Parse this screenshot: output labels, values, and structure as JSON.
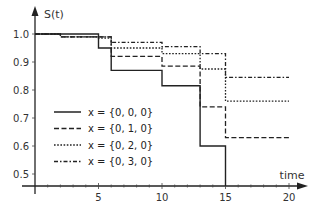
{
  "chart_data": {
    "type": "line",
    "subtype": "step",
    "title": "",
    "xlabel": "time",
    "ylabel": "S(t)",
    "xlim": [
      0,
      20
    ],
    "ylim": [
      0.45,
      1.0
    ],
    "x_ticks": [
      5,
      10,
      15,
      20
    ],
    "x_tick_labels": [
      "5",
      "10",
      "15",
      "20"
    ],
    "y_ticks": [
      0.5,
      0.6,
      0.7,
      0.8,
      0.9,
      1.0
    ],
    "y_tick_labels": [
      "0.5",
      "0.6",
      "0.7",
      "0.8",
      "0.9",
      "1.0"
    ],
    "grid": false,
    "legend_position": "lower-left inside",
    "series": [
      {
        "name": "x = {0, 0, 0}",
        "style": "solid",
        "steps": [
          [
            0,
            1.0
          ],
          [
            5,
            0.95
          ],
          [
            6,
            0.87
          ],
          [
            10,
            0.815
          ],
          [
            13,
            0.6
          ],
          [
            15,
            0.0
          ]
        ],
        "end": 15
      },
      {
        "name": "x = {0, 1, 0}",
        "style": "dashed",
        "steps": [
          [
            0,
            1.0
          ],
          [
            2,
            0.99
          ],
          [
            5,
            0.99
          ],
          [
            6,
            0.92
          ],
          [
            10,
            0.885
          ],
          [
            13,
            0.74
          ],
          [
            15,
            0.63
          ]
        ],
        "end": 20
      },
      {
        "name": "x = {0, 2, 0}",
        "style": "dotted",
        "steps": [
          [
            0,
            1.0
          ],
          [
            2,
            0.99
          ],
          [
            5,
            0.985
          ],
          [
            6,
            0.95
          ],
          [
            10,
            0.93
          ],
          [
            13,
            0.875
          ],
          [
            15,
            0.76
          ]
        ],
        "end": 20
      },
      {
        "name": "x = {0, 3, 0}",
        "style": "dashdot",
        "steps": [
          [
            0,
            1.0
          ],
          [
            2,
            0.99
          ],
          [
            5,
            0.99
          ],
          [
            6,
            0.97
          ],
          [
            10,
            0.955
          ],
          [
            13,
            0.93
          ],
          [
            15,
            0.845
          ]
        ],
        "end": 20
      }
    ]
  }
}
